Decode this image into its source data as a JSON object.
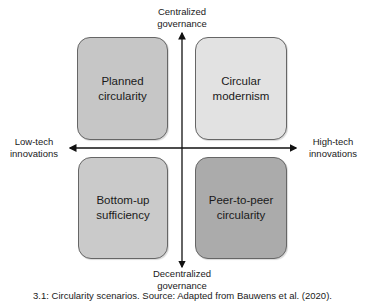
{
  "diagram": {
    "type": "quadrant-matrix",
    "axes": {
      "vertical": {
        "top_label": "Centralized governance",
        "top_lines": [
          "Centralized",
          "governance"
        ],
        "bottom_label": "Decentralized governance",
        "bottom_lines": [
          "Decentralized",
          "governance"
        ]
      },
      "horizontal": {
        "left_label": "Low-tech innovations",
        "left_lines": [
          "Low-tech",
          "innovations"
        ],
        "right_label": "High-tech innovations",
        "right_lines": [
          "High-tech",
          "innovations"
        ]
      }
    },
    "quadrants": [
      {
        "position": "top-left",
        "lines": [
          "Planned",
          "circularity"
        ],
        "label": "Planned circularity",
        "fill": "#c6c6c6"
      },
      {
        "position": "top-right",
        "lines": [
          "Circular",
          "modernism"
        ],
        "label": "Circular modernism",
        "fill": "#e2e2e2"
      },
      {
        "position": "bottom-left",
        "lines": [
          "Bottom-up",
          "sufficiency"
        ],
        "label": "Bottom-up sufficiency",
        "fill": "#cacaca"
      },
      {
        "position": "bottom-right",
        "lines": [
          "Peer-to-peer",
          "circularity"
        ],
        "label": "Peer-to-peer circularity",
        "fill": "#ababab"
      }
    ],
    "caption": "3.1: Circularity scenarios. Source: Adapted from Bauwens et al. (2020)."
  }
}
